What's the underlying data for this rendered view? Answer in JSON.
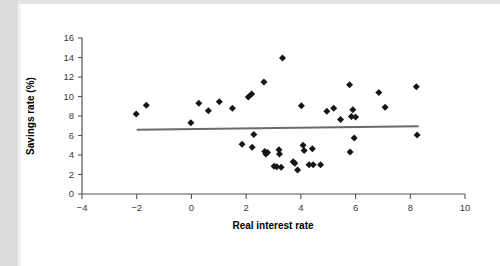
{
  "chart_data": {
    "type": "scatter",
    "title": "",
    "xlabel": "Real interest rate",
    "ylabel": "Savings rate (%)",
    "xlim": [
      -4,
      10
    ],
    "ylim": [
      0,
      16
    ],
    "xticks": [
      -4,
      -2,
      0,
      2,
      4,
      6,
      8,
      10
    ],
    "xtick_labels": [
      "−4",
      "−2",
      "0",
      "2",
      "4",
      "6",
      "8",
      "10"
    ],
    "yticks": [
      0,
      2,
      4,
      6,
      8,
      10,
      12,
      14,
      16
    ],
    "ytick_labels": [
      "0",
      "2",
      "4",
      "6",
      "8",
      "10",
      "12",
      "14",
      "16"
    ],
    "grid": false,
    "legend": null,
    "marker": "diamond",
    "marker_color": "#161616",
    "points": [
      {
        "x": -2.02,
        "y": 8.2
      },
      {
        "x": -1.65,
        "y": 9.1
      },
      {
        "x": -0.02,
        "y": 7.3
      },
      {
        "x": 0.27,
        "y": 9.3
      },
      {
        "x": 0.62,
        "y": 8.55
      },
      {
        "x": 1.02,
        "y": 9.45
      },
      {
        "x": 1.5,
        "y": 8.8
      },
      {
        "x": 1.85,
        "y": 5.1
      },
      {
        "x": 2.08,
        "y": 9.95
      },
      {
        "x": 2.2,
        "y": 10.25
      },
      {
        "x": 2.22,
        "y": 4.8
      },
      {
        "x": 2.28,
        "y": 6.1
      },
      {
        "x": 2.65,
        "y": 11.5
      },
      {
        "x": 2.68,
        "y": 4.35
      },
      {
        "x": 2.72,
        "y": 4.1
      },
      {
        "x": 2.78,
        "y": 4.25
      },
      {
        "x": 3.02,
        "y": 2.85
      },
      {
        "x": 3.12,
        "y": 2.8
      },
      {
        "x": 3.2,
        "y": 4.55
      },
      {
        "x": 3.22,
        "y": 4.1
      },
      {
        "x": 3.28,
        "y": 2.75
      },
      {
        "x": 3.33,
        "y": 13.95
      },
      {
        "x": 3.72,
        "y": 3.3
      },
      {
        "x": 3.78,
        "y": 3.15
      },
      {
        "x": 3.88,
        "y": 2.45
      },
      {
        "x": 4.02,
        "y": 9.05
      },
      {
        "x": 4.08,
        "y": 5.0
      },
      {
        "x": 4.12,
        "y": 4.45
      },
      {
        "x": 4.3,
        "y": 3.0
      },
      {
        "x": 4.42,
        "y": 4.65
      },
      {
        "x": 4.45,
        "y": 3.0
      },
      {
        "x": 4.72,
        "y": 3.0
      },
      {
        "x": 4.95,
        "y": 8.5
      },
      {
        "x": 5.2,
        "y": 8.8
      },
      {
        "x": 5.45,
        "y": 7.65
      },
      {
        "x": 5.78,
        "y": 11.2
      },
      {
        "x": 5.8,
        "y": 4.3
      },
      {
        "x": 5.85,
        "y": 7.95
      },
      {
        "x": 5.9,
        "y": 8.65
      },
      {
        "x": 5.95,
        "y": 5.75
      },
      {
        "x": 6.0,
        "y": 7.9
      },
      {
        "x": 6.85,
        "y": 10.4
      },
      {
        "x": 7.08,
        "y": 8.9
      },
      {
        "x": 8.22,
        "y": 11.0
      },
      {
        "x": 8.25,
        "y": 6.05
      }
    ],
    "trendline": {
      "color": "#6b6b6b",
      "x_start": -2.0,
      "y_start": 6.6,
      "x_end": 8.3,
      "y_end": 6.95
    }
  }
}
